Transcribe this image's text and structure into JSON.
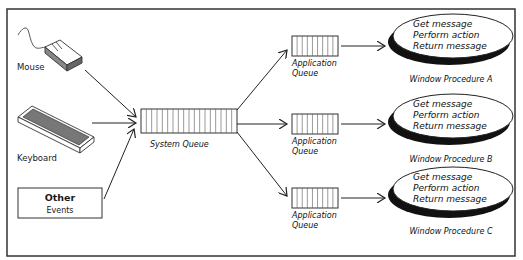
{
  "diagram": {
    "title": "",
    "inputs": {
      "mouse": {
        "label": "Mouse"
      },
      "keyboard": {
        "label": "Keyboard"
      },
      "other": {
        "title": "Other",
        "subtitle": "Events"
      }
    },
    "system_queue": {
      "label": "System Queue",
      "slots": 18
    },
    "application_queues": [
      {
        "line1": "Application",
        "line2": "Queue",
        "slots": 9
      },
      {
        "line1": "Application",
        "line2": "Queue",
        "slots": 9
      },
      {
        "line1": "Application",
        "line2": "Queue",
        "slots": 9
      }
    ],
    "window_procedures": [
      {
        "label": "Window Procedure A",
        "steps": [
          "Get message",
          "Perform action",
          "Return message"
        ]
      },
      {
        "label": "Window Procedure B",
        "steps": [
          "Get message",
          "Perform action",
          "Return message"
        ]
      },
      {
        "label": "Window Procedure C",
        "steps": [
          "Get message",
          "Perform action",
          "Return message"
        ]
      }
    ],
    "colors": {
      "stroke": "#222222",
      "device_fill": "#777777",
      "background": "#ffffff"
    }
  }
}
